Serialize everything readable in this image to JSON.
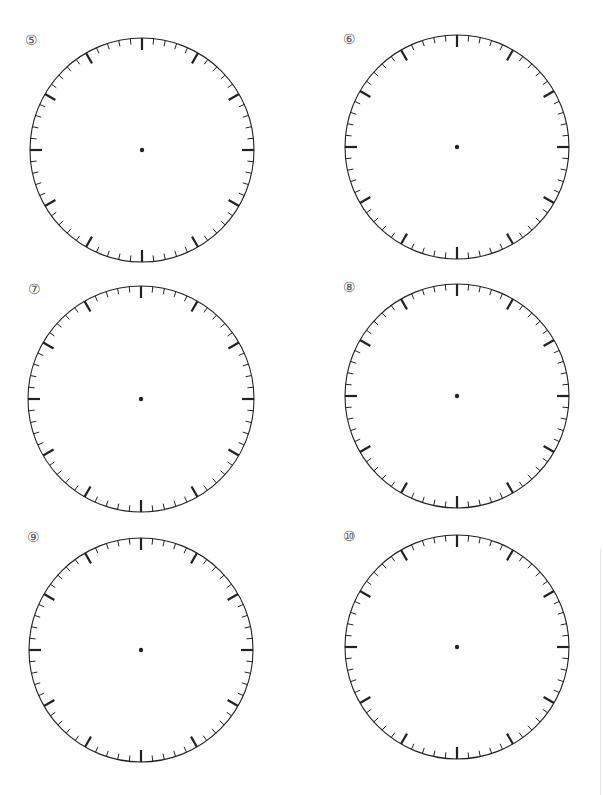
{
  "worksheet": {
    "clocks": [
      {
        "label": "⑤",
        "cx": 142,
        "cy": 150,
        "r": 112,
        "label_x": 25,
        "label_y": 33
      },
      {
        "label": "⑥",
        "cx": 457,
        "cy": 147,
        "r": 112,
        "label_x": 343,
        "label_y": 32
      },
      {
        "label": "⑦",
        "cx": 141,
        "cy": 399,
        "r": 113,
        "label_x": 28,
        "label_y": 282
      },
      {
        "label": "⑧",
        "cx": 457,
        "cy": 396,
        "r": 112,
        "label_x": 343,
        "label_y": 280
      },
      {
        "label": "⑨",
        "cx": 141,
        "cy": 650,
        "r": 112,
        "label_x": 27,
        "label_y": 530
      },
      {
        "label": "⑩",
        "cx": 457,
        "cy": 647,
        "r": 112,
        "label_x": 343,
        "label_y": 529
      }
    ],
    "tick_count": 60,
    "major_every": 5,
    "major_len": 12,
    "minor_len": 6,
    "colors": {
      "stroke": "#222222",
      "label": "#555555"
    }
  }
}
